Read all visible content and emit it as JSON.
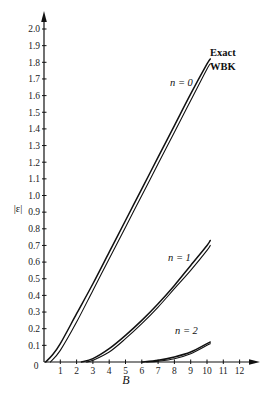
{
  "chart_data": {
    "type": "line",
    "title": "",
    "xlabel": "B",
    "ylabel": "|ε|",
    "xlim": [
      0,
      12.8
    ],
    "ylim": [
      0,
      2.1
    ],
    "grid": false,
    "x_ticks": [
      "0",
      "1",
      "2",
      "3",
      "4",
      "5",
      "6",
      "7",
      "8",
      "9",
      "10",
      "11",
      "12"
    ],
    "y_ticks": [
      "0.1",
      "0.2",
      "0.3",
      "0.4",
      "0.5",
      "0.6",
      "0.7",
      "0.8",
      "0.9",
      "1.0",
      "1.1",
      "1.2",
      "1.3",
      "1.4",
      "1.5",
      "1.6",
      "1.7",
      "1.8",
      "1.9",
      "2.0"
    ],
    "legend": [
      "Exact",
      "WBK"
    ],
    "annotations": [
      "n = 0",
      "n = 1",
      "n = 2",
      "Exact",
      "WBK"
    ],
    "series": [
      {
        "name": "n = 0 Exact",
        "x": [
          0.1,
          0.5,
          1,
          2,
          3,
          4,
          5,
          6,
          7,
          8,
          9,
          10,
          10.2
        ],
        "values": [
          0.0,
          0.04,
          0.11,
          0.29,
          0.47,
          0.66,
          0.85,
          1.04,
          1.23,
          1.42,
          1.61,
          1.79,
          1.82
        ]
      },
      {
        "name": "n = 0 WBK",
        "x": [
          0.4,
          1,
          2,
          3,
          4,
          5,
          6,
          7,
          8,
          9,
          10,
          10.2
        ],
        "values": [
          0.0,
          0.07,
          0.24,
          0.43,
          0.62,
          0.81,
          1.0,
          1.19,
          1.38,
          1.57,
          1.76,
          1.79
        ]
      },
      {
        "name": "n = 1 Exact",
        "x": [
          2.3,
          3,
          4,
          5,
          6,
          7,
          8,
          9,
          10,
          10.2
        ],
        "values": [
          0.0,
          0.02,
          0.08,
          0.16,
          0.25,
          0.35,
          0.46,
          0.58,
          0.7,
          0.73
        ]
      },
      {
        "name": "n = 1 WBK",
        "x": [
          2.6,
          3,
          4,
          5,
          6,
          7,
          8,
          9,
          10,
          10.2
        ],
        "values": [
          0.0,
          0.01,
          0.06,
          0.14,
          0.23,
          0.33,
          0.44,
          0.55,
          0.67,
          0.7
        ]
      },
      {
        "name": "n = 2 Exact",
        "x": [
          6.0,
          7,
          8,
          9,
          10,
          10.2
        ],
        "values": [
          0.0,
          0.01,
          0.03,
          0.06,
          0.11,
          0.12
        ]
      },
      {
        "name": "n = 2 WBK",
        "x": [
          6.3,
          7,
          8,
          9,
          10,
          10.2
        ],
        "values": [
          0.0,
          0.005,
          0.02,
          0.05,
          0.1,
          0.11
        ]
      }
    ]
  },
  "labels": {
    "y_axis": "|ε|",
    "x_axis": "B",
    "origin": "0",
    "n0": "n = 0",
    "n1": "n = 1",
    "n2": "n = 2",
    "exact": "Exact",
    "wbk": "WBK"
  }
}
